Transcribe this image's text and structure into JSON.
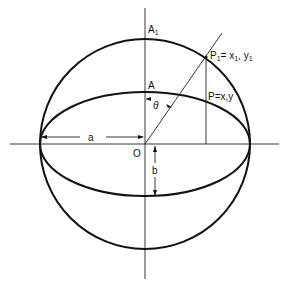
{
  "diagram": {
    "labels": {
      "A1": "A",
      "A1_sub": "1",
      "A": "A",
      "O": "O",
      "a": "a",
      "b": "b",
      "theta": "θ",
      "P1": "P",
      "P1_sub": "1",
      "P1_eq": "= x",
      "P1_xsub": "1",
      "P1_y": ", y",
      "P1_ysub": "1",
      "P": "P=x,y"
    },
    "geometry": {
      "center": [
        145,
        144
      ],
      "circle_radius": 105,
      "ellipse_a": 105,
      "ellipse_b": 52
    }
  }
}
